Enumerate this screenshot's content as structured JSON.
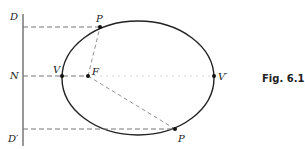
{
  "figure": {
    "caption": "Fig. 6.1",
    "labels": {
      "D": "D",
      "N": "N",
      "D_prime": "D′",
      "V": "V",
      "V_prime": "V′",
      "F": "F",
      "P_top": "P",
      "P_bottom": "P"
    }
  }
}
